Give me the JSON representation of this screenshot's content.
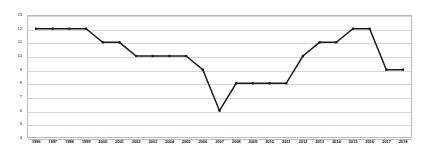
{
  "chart_data": {
    "type": "line",
    "title": "",
    "subtitle": "",
    "xlabel": "",
    "ylabel": "",
    "categories": [
      "1996",
      "1997",
      "1998",
      "1999",
      "2000",
      "2001",
      "2002",
      "2003",
      "2004",
      "2005",
      "2006",
      "2007",
      "2008",
      "2009",
      "2010",
      "2011",
      "2012",
      "2013",
      "2014",
      "2015",
      "2016",
      "2017",
      "2018"
    ],
    "values": [
      12,
      12,
      12,
      12,
      11,
      11,
      10,
      10,
      10,
      10,
      9,
      6,
      8,
      8,
      8,
      8,
      10,
      11,
      11,
      12,
      12,
      9,
      9
    ],
    "series": [
      {
        "name": "",
        "values": [
          12,
          12,
          12,
          12,
          11,
          11,
          10,
          10,
          10,
          10,
          9,
          6,
          8,
          8,
          8,
          8,
          10,
          11,
          11,
          12,
          12,
          9,
          9
        ]
      }
    ],
    "ylim": [
      4,
      13
    ],
    "yticks": [
      13,
      12,
      11,
      10,
      9,
      8,
      7,
      6,
      5,
      4
    ],
    "ytick_labels": [
      "13",
      "12",
      "11",
      "10",
      "9",
      "8",
      "7",
      "6",
      "5",
      "4"
    ],
    "grid": true,
    "grid_axis": "y",
    "legend": false,
    "legend_position": "none",
    "markers": true,
    "line_color": "#1a1a1a",
    "marker_color": "#1a1a1a",
    "grid_color": "#d6d6d6",
    "frame_color": "#b9b9b9",
    "background_color": "#ffffff"
  }
}
